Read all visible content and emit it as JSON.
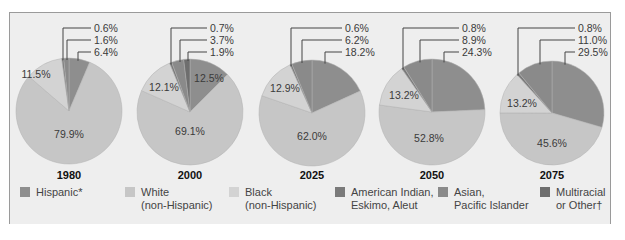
{
  "colors": {
    "hispanic": "#8e8e8e",
    "white": "#c6c6c6",
    "black": "#d3d3d3",
    "american_indian": "#7a7a7a",
    "asian": "#8a8a8a",
    "multiracial": "#6e6e6e",
    "frame_bg": "#eeeeee"
  },
  "legend": [
    {
      "key": "hispanic",
      "label": "Hispanic*"
    },
    {
      "key": "white",
      "label": "White\n(non-Hispanic)"
    },
    {
      "key": "black",
      "label": "Black\n(non-Hispanic)"
    },
    {
      "key": "american_indian",
      "label": "American Indian,\nEskimo, Aleut"
    },
    {
      "key": "asian",
      "label": "Asian,\nPacific Islander"
    },
    {
      "key": "multiracial",
      "label": "Multiracial\nor Other†"
    }
  ],
  "chart_data": {
    "type": "pie",
    "title": "",
    "categories": [
      "Hispanic*",
      "White (non-Hispanic)",
      "Black (non-Hispanic)",
      "American Indian, Eskimo, Aleut",
      "Asian, Pacific Islander",
      "Multiracial or Other"
    ],
    "charts": [
      {
        "year": "1980",
        "slices": [
          {
            "category": "Hispanic*",
            "value": 6.4,
            "label": "6.4%"
          },
          {
            "category": "White (non-Hispanic)",
            "value": 79.9,
            "label": "79.9%"
          },
          {
            "category": "Black (non-Hispanic)",
            "value": 11.5,
            "label": "11.5%"
          },
          {
            "category": "American Indian, Eskimo, Aleut",
            "value": 0.6,
            "label": "0.6%"
          },
          {
            "category": "Asian, Pacific Islander",
            "value": 1.6,
            "label": "1.6%"
          }
        ]
      },
      {
        "year": "2000",
        "slices": [
          {
            "category": "Hispanic*",
            "value": 12.5,
            "label": "12.5%"
          },
          {
            "category": "White (non-Hispanic)",
            "value": 69.1,
            "label": "69.1%"
          },
          {
            "category": "Black (non-Hispanic)",
            "value": 12.1,
            "label": "12.1%"
          },
          {
            "category": "American Indian, Eskimo, Aleut",
            "value": 0.7,
            "label": "0.7%"
          },
          {
            "category": "Asian, Pacific Islander",
            "value": 3.7,
            "label": "3.7%"
          },
          {
            "category": "Multiracial or Other",
            "value": 1.9,
            "label": "1.9%"
          }
        ]
      },
      {
        "year": "2025",
        "slices": [
          {
            "category": "Hispanic*",
            "value": 18.2,
            "label": "18.2%"
          },
          {
            "category": "White (non-Hispanic)",
            "value": 62.0,
            "label": "62.0%"
          },
          {
            "category": "Black (non-Hispanic)",
            "value": 12.9,
            "label": "12.9%"
          },
          {
            "category": "American Indian, Eskimo, Aleut",
            "value": 0.6,
            "label": "0.6%"
          },
          {
            "category": "Asian, Pacific Islander",
            "value": 6.2,
            "label": "6.2%"
          }
        ]
      },
      {
        "year": "2050",
        "slices": [
          {
            "category": "Hispanic*",
            "value": 24.3,
            "label": "24.3%"
          },
          {
            "category": "White (non-Hispanic)",
            "value": 52.8,
            "label": "52.8%"
          },
          {
            "category": "Black (non-Hispanic)",
            "value": 13.2,
            "label": "13.2%"
          },
          {
            "category": "American Indian, Eskimo, Aleut",
            "value": 0.8,
            "label": "0.8%"
          },
          {
            "category": "Asian, Pacific Islander",
            "value": 8.9,
            "label": "8.9%"
          }
        ]
      },
      {
        "year": "2075",
        "slices": [
          {
            "category": "Hispanic*",
            "value": 29.5,
            "label": "29.5%"
          },
          {
            "category": "White (non-Hispanic)",
            "value": 45.6,
            "label": "45.6%"
          },
          {
            "category": "Black (non-Hispanic)",
            "value": 13.2,
            "label": "13.2%"
          },
          {
            "category": "American Indian, Eskimo, Aleut",
            "value": 0.8,
            "label": "0.8%"
          },
          {
            "category": "Asian, Pacific Islander",
            "value": 11.0,
            "label": "11.0%"
          }
        ]
      }
    ],
    "legend_position": "bottom",
    "grid": false
  },
  "pies": [
    {
      "year": "1980",
      "cx": 69,
      "cy": 111,
      "r": 53,
      "wedges": [
        {
          "key": "hispanic",
          "value": 6.4
        },
        {
          "key": "white",
          "value": 79.9
        },
        {
          "key": "black",
          "value": 11.5
        },
        {
          "key": "american_indian",
          "value": 0.6
        },
        {
          "key": "asian",
          "value": 1.6
        }
      ],
      "inner_labels": [
        {
          "text": "11.5%",
          "x": 36,
          "y": 78
        },
        {
          "text": "79.9%",
          "x": 69,
          "y": 138
        }
      ],
      "leaders": [
        {
          "text": "0.6%",
          "vx": 63,
          "y": 28
        },
        {
          "text": "1.6%",
          "vx": 67,
          "y": 40
        },
        {
          "text": "6.4%",
          "vx": 78,
          "y": 52
        }
      ],
      "label_x": 94
    },
    {
      "year": "2000",
      "cx": 190,
      "cy": 112,
      "r": 53,
      "wedges": [
        {
          "key": "hispanic",
          "value": 12.5
        },
        {
          "key": "white",
          "value": 69.1
        },
        {
          "key": "black",
          "value": 12.1
        },
        {
          "key": "american_indian",
          "value": 0.7
        },
        {
          "key": "asian",
          "value": 3.7
        },
        {
          "key": "multiracial",
          "value": 1.9
        }
      ],
      "inner_labels": [
        {
          "text": "12.5%",
          "x": 209,
          "y": 82
        },
        {
          "text": "12.1%",
          "x": 164,
          "y": 91
        },
        {
          "text": "69.1%",
          "x": 190,
          "y": 135
        }
      ],
      "leaders": [
        {
          "text": "0.7%",
          "vx": 171,
          "y": 28
        },
        {
          "text": "3.7%",
          "vx": 180,
          "y": 40
        },
        {
          "text": "1.9%",
          "vx": 188,
          "y": 52
        }
      ],
      "label_x": 210
    },
    {
      "year": "2025",
      "cx": 312,
      "cy": 113,
      "r": 53,
      "wedges": [
        {
          "key": "hispanic",
          "value": 18.2
        },
        {
          "key": "white",
          "value": 62.0
        },
        {
          "key": "black",
          "value": 12.9
        },
        {
          "key": "american_indian",
          "value": 0.6
        },
        {
          "key": "asian",
          "value": 6.2
        }
      ],
      "inner_labels": [
        {
          "text": "12.9%",
          "x": 285,
          "y": 92
        },
        {
          "text": "62.0%",
          "x": 312,
          "y": 140
        }
      ],
      "leaders": [
        {
          "text": "0.6%",
          "vx": 291,
          "y": 28
        },
        {
          "text": "6.2%",
          "vx": 302,
          "y": 40
        },
        {
          "text": "18.2%",
          "vx": 325,
          "y": 52
        }
      ],
      "label_x": 345
    },
    {
      "year": "2050",
      "cx": 432,
      "cy": 112,
      "r": 53,
      "wedges": [
        {
          "key": "hispanic",
          "value": 24.3
        },
        {
          "key": "white",
          "value": 52.8
        },
        {
          "key": "black",
          "value": 13.2
        },
        {
          "key": "american_indian",
          "value": 0.8
        },
        {
          "key": "asian",
          "value": 8.9
        }
      ],
      "inner_labels": [
        {
          "text": "13.2%",
          "x": 404,
          "y": 99
        },
        {
          "text": "52.8%",
          "x": 429,
          "y": 142
        }
      ],
      "leaders": [
        {
          "text": "0.8%",
          "vx": 403,
          "y": 28
        },
        {
          "text": "8.9%",
          "vx": 420,
          "y": 40
        },
        {
          "text": "24.3%",
          "vx": 444,
          "y": 52
        }
      ],
      "label_x": 462
    },
    {
      "year": "2075",
      "cx": 552,
      "cy": 113,
      "r": 52,
      "wedges": [
        {
          "key": "hispanic",
          "value": 29.5
        },
        {
          "key": "white",
          "value": 45.6
        },
        {
          "key": "black",
          "value": 13.2
        },
        {
          "key": "american_indian",
          "value": 0.8
        },
        {
          "key": "asian",
          "value": 11.0
        }
      ],
      "inner_labels": [
        {
          "text": "13.2%",
          "x": 522,
          "y": 107
        },
        {
          "text": "45.6%",
          "x": 552,
          "y": 147
        }
      ],
      "leaders": [
        {
          "text": "0.8%",
          "vx": 518,
          "y": 28
        },
        {
          "text": "11.0%",
          "vx": 540,
          "y": 40
        },
        {
          "text": "29.5%",
          "vx": 565,
          "y": 52
        }
      ],
      "label_x": 578
    }
  ]
}
